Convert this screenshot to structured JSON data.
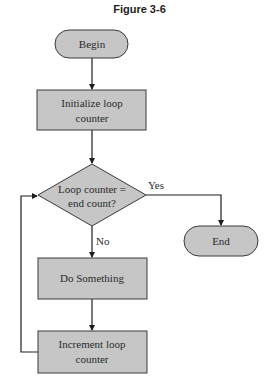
{
  "figure": {
    "title": "Figure 3-6"
  },
  "nodes": {
    "begin": {
      "type": "terminal",
      "label": "Begin"
    },
    "init": {
      "type": "process",
      "line1": "Initialize loop",
      "line2": "counter"
    },
    "decision": {
      "type": "decision",
      "line1": "Loop counter =",
      "line2": "end count?"
    },
    "do_something": {
      "type": "process",
      "label": "Do Something"
    },
    "increment": {
      "type": "process",
      "line1": "Increment loop",
      "line2": "counter"
    },
    "end": {
      "type": "terminal",
      "label": "End"
    }
  },
  "edges": {
    "yes_label": "Yes",
    "no_label": "No"
  },
  "colors": {
    "fill": "#c6c6c6",
    "stroke": "#3a3a3a",
    "text": "#2a2a2a"
  }
}
